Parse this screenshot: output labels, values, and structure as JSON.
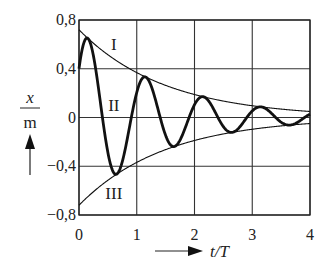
{
  "chart_data": {
    "type": "line",
    "title": "",
    "xlabel": "t/T",
    "ylabel": "x/m",
    "ylabel_numerator": "x",
    "ylabel_denominator": "m",
    "xlim": [
      0,
      4
    ],
    "ylim": [
      -0.8,
      0.8
    ],
    "x_ticks": [
      0,
      1,
      2,
      3,
      4
    ],
    "x_tick_labels": [
      "0",
      "1",
      "2",
      "3",
      "4"
    ],
    "y_ticks": [
      0.8,
      0.4,
      0,
      -0.4,
      -0.8
    ],
    "y_tick_labels": [
      "0,8",
      "0,4",
      "0",
      "−0,4",
      "−0,8"
    ],
    "grid": true,
    "series": [
      {
        "name": "I",
        "description": "upper envelope",
        "model": {
          "amplitude": 0.72,
          "decay": 0.67
        },
        "x": [
          0,
          0.5,
          1,
          1.5,
          2,
          2.5,
          3,
          3.5,
          4
        ],
        "values": [
          0.72,
          0.52,
          0.37,
          0.26,
          0.19,
          0.135,
          0.097,
          0.069,
          0.05
        ]
      },
      {
        "name": "II",
        "description": "damped oscillation",
        "model": {
          "amplitude": 0.72,
          "decay": 0.67,
          "omega_cycles": 1.0,
          "phase": -0.98
        },
        "key_points": [
          {
            "t": 0,
            "x": 0.4
          },
          {
            "t": 0.12,
            "x": 0.65
          },
          {
            "t": 0.62,
            "x": -0.45
          },
          {
            "t": 1.15,
            "x": 0.32
          },
          {
            "t": 1.64,
            "x": -0.24
          },
          {
            "t": 2.12,
            "x": 0.16
          },
          {
            "t": 2.63,
            "x": -0.12
          },
          {
            "t": 3.12,
            "x": 0.08
          },
          {
            "t": 3.63,
            "x": -0.06
          },
          {
            "t": 4,
            "x": 0.04
          }
        ]
      },
      {
        "name": "III",
        "description": "lower envelope",
        "model": {
          "amplitude": -0.72,
          "decay": 0.67
        },
        "x": [
          0,
          0.5,
          1,
          1.5,
          2,
          2.5,
          3,
          3.5,
          4
        ],
        "values": [
          -0.72,
          -0.52,
          -0.37,
          -0.26,
          -0.19,
          -0.135,
          -0.097,
          -0.069,
          -0.05
        ]
      }
    ],
    "annotations": [
      {
        "text": "I",
        "t": 0.95,
        "x": 0.6
      },
      {
        "text": "II",
        "t": 0.95,
        "x": 0.1
      },
      {
        "text": "III",
        "t": 0.95,
        "x": -0.62
      }
    ],
    "legend": "none"
  }
}
